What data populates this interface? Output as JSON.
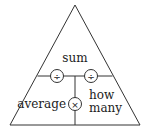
{
  "diagram": {
    "type": "formula-triangle",
    "top_label": "sum",
    "bottom_left_label": "average",
    "bottom_right_label_line1": "how",
    "bottom_right_label_line2": "many",
    "operators": {
      "left_divide": "÷",
      "right_divide": "÷",
      "multiply": "×"
    },
    "colors": {
      "stroke": "#333333",
      "text": "#222222",
      "background": "#ffffff"
    }
  }
}
